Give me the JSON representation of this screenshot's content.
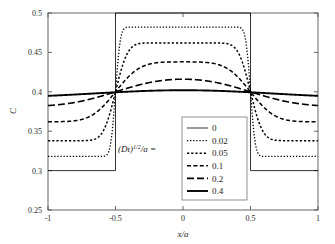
{
  "chart_data": {
    "type": "line",
    "title": "",
    "xlabel": "x/a",
    "ylabel": "C",
    "xlim": [
      -1,
      1
    ],
    "ylim": [
      0.25,
      0.5
    ],
    "xticks": [
      "-1",
      "-0.5",
      "0",
      "0.5",
      "1"
    ],
    "xtick_values": [
      -1,
      -0.5,
      0,
      0.5,
      1
    ],
    "yticks": [
      "0.25",
      "0.3",
      "0.35",
      "0.4",
      "0.45",
      "0.5"
    ],
    "ytick_values": [
      0.25,
      0.3,
      0.35,
      0.4,
      0.45,
      0.5
    ],
    "grid": false,
    "legend_position": "center",
    "legend_title": "(Dt)^(1/2)/a =",
    "annotation": "(Dt)1/2/a =",
    "series": [
      {
        "name": "0",
        "style": "solid-thin",
        "peak_value": 0.5,
        "edge_value": 0.3,
        "crossing_value": 0.4,
        "x": [
          -1,
          -0.9,
          -0.8,
          -0.7,
          -0.6,
          -0.55,
          -0.5,
          -0.45,
          -0.4,
          -0.3,
          -0.2,
          -0.1,
          0,
          0.1,
          0.2,
          0.3,
          0.4,
          0.45,
          0.5,
          0.55,
          0.6,
          0.7,
          0.8,
          0.9,
          1
        ],
        "values": [
          0.3,
          0.3,
          0.3,
          0.3,
          0.3,
          0.3,
          0.4,
          0.5,
          0.5,
          0.5,
          0.5,
          0.5,
          0.5,
          0.5,
          0.5,
          0.5,
          0.5,
          0.5,
          0.4,
          0.3,
          0.3,
          0.3,
          0.3,
          0.3,
          0.3
        ]
      },
      {
        "name": "0.02",
        "style": "dotted-fine",
        "peak_value": 0.482,
        "edge_value": 0.318,
        "crossing_value": 0.4
      },
      {
        "name": "0.05",
        "style": "dotted",
        "peak_value": 0.462,
        "edge_value": 0.338,
        "crossing_value": 0.4
      },
      {
        "name": "0.1",
        "style": "dash-short",
        "peak_value": 0.438,
        "edge_value": 0.364,
        "crossing_value": 0.4
      },
      {
        "name": "0.2",
        "style": "dash-long",
        "peak_value": 0.416,
        "edge_value": 0.385,
        "crossing_value": 0.4
      },
      {
        "name": "0.4",
        "style": "solid-thick",
        "peak_value": 0.402,
        "edge_value": 0.398,
        "crossing_value": 0.4
      }
    ]
  },
  "colors": {
    "axis": "#555555",
    "curve": "#000000",
    "legend_border": "#777777",
    "background": "#ffffff"
  }
}
